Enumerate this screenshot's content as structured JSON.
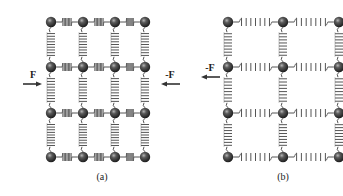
{
  "figure": {
    "colors": {
      "ball": "#3a3a3a",
      "ball_highlight": "#9a9a9a",
      "spring": "#555555",
      "arrow": "#333333",
      "text": "#222222",
      "background": "#ffffff"
    },
    "panels": [
      {
        "id": "a",
        "caption": "(a)",
        "state": "compressed",
        "columns_x": [
          51,
          83,
          115,
          145
        ],
        "rows_y": [
          22,
          67,
          113,
          157
        ],
        "forces": [
          {
            "label": "F",
            "x": 33,
            "y": 82,
            "direction": "right"
          },
          {
            "label": "-F",
            "x": 170,
            "y": 82,
            "direction": "left"
          }
        ],
        "caption_pos": [
          102,
          180
        ]
      },
      {
        "id": "b",
        "caption": "(b)",
        "state": "stretched",
        "columns_x": [
          228,
          283,
          339
        ],
        "rows_y": [
          22,
          67,
          113,
          157
        ],
        "forces": [
          {
            "label": "-F",
            "x": 210,
            "y": 75,
            "direction": "left"
          }
        ],
        "caption_pos": [
          283,
          180
        ]
      }
    ]
  }
}
